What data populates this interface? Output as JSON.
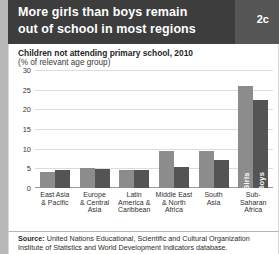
{
  "header": {
    "title_line1": "More girls than boys remain",
    "title_line2": "out of school in most regions",
    "badge": "2c"
  },
  "chart_data": {
    "type": "bar",
    "title": "Children not attending primary school, 2010",
    "subtitle": "(% of relevant age group)",
    "xlabel": "",
    "ylabel": "(% of relevant age group)",
    "ylim": [
      0,
      30
    ],
    "yticks": [
      0,
      5,
      10,
      15,
      20,
      25,
      30
    ],
    "ytick_labels": [
      "0",
      "5",
      "10",
      "15",
      "20",
      "25",
      "30"
    ],
    "grid": true,
    "legend_position": "in-bars",
    "categories": [
      "East Asia & Pacific",
      "Europe & Central Asia",
      "Latin America & Caribbean",
      "Middle East & North Africa",
      "South Asia",
      "Sub-Saharan Africa"
    ],
    "category_lines": [
      [
        "East Asia",
        "& Pacific",
        ""
      ],
      [
        "Europe",
        "& Central",
        "Asia"
      ],
      [
        "Latin",
        "America &",
        "Caribbean"
      ],
      [
        "Middle East",
        "& North",
        "Africa"
      ],
      [
        "South",
        "Asia",
        ""
      ],
      [
        "Sub-Saharan",
        "Africa",
        ""
      ]
    ],
    "series": [
      {
        "name": "Girls",
        "color": "#8c8c8c",
        "values": [
          4.0,
          5.2,
          4.7,
          9.5,
          9.4,
          26.0
        ]
      },
      {
        "name": "Boys",
        "color": "#545454",
        "values": [
          4.5,
          4.8,
          4.6,
          5.4,
          7.0,
          22.5
        ]
      }
    ]
  },
  "footer": {
    "source_label": "Source:",
    "source_text": " United Nations Educational, Scientific and Cultural Organization Institute of Statistics and World Development Indicators database."
  }
}
